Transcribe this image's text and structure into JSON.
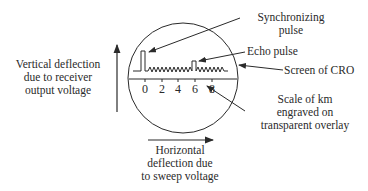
{
  "diagram": {
    "labels": {
      "vertical": [
        "Vertical deflection",
        "due to receiver",
        "output voltage"
      ],
      "sync": [
        "Synchronizing",
        "pulse"
      ],
      "echo": "Echo pulse",
      "screen": "Screen of CRO",
      "scale": [
        "Scale of km",
        "engraved on",
        "transparent overlay"
      ],
      "horizontal": [
        "Horizontal",
        "deflection due",
        "to sweep voltage"
      ]
    },
    "scale_ticks": [
      "0",
      "2",
      "4",
      "6",
      "8"
    ],
    "colors": {
      "line": "#2a2a2a",
      "background": "#ffffff"
    }
  }
}
